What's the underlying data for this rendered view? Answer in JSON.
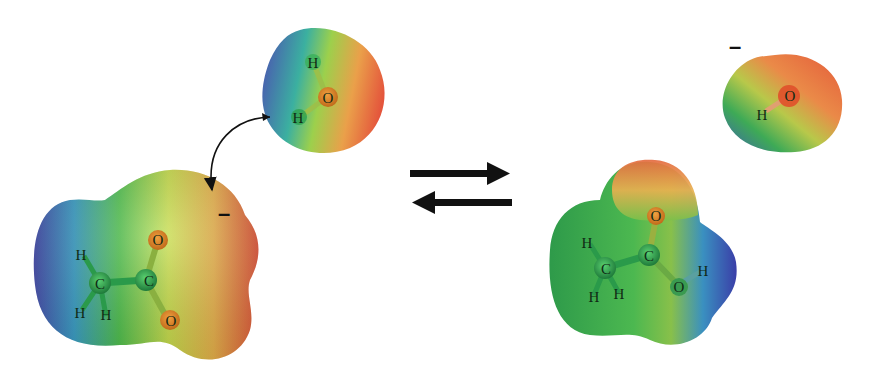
{
  "diagram": {
    "reactants": {
      "acetate": {
        "atoms": [
          "H",
          "H",
          "H",
          "C",
          "C",
          "O",
          "O"
        ],
        "labels": {
          "h1": "H",
          "h2": "H",
          "h3": "H",
          "c1": "C",
          "c2": "C",
          "o1": "O",
          "o2": "O"
        },
        "charge": "–"
      },
      "water": {
        "labels": {
          "h1": "H",
          "h2": "H",
          "o": "O"
        }
      }
    },
    "products": {
      "acetic_acid": {
        "labels": {
          "h1": "H",
          "h2": "H",
          "h3": "H",
          "c1": "C",
          "c2": "C",
          "o1": "O",
          "o2": "O",
          "h4": "H"
        }
      },
      "hydroxide": {
        "labels": {
          "o": "O",
          "h": "H"
        },
        "charge": "–"
      }
    },
    "arrows": {
      "equilibrium": "forward-and-reverse",
      "proton_transfer": "curved arrow from water H to acetate O"
    },
    "colors": {
      "negative_potential": "#e8503a",
      "neutral": "#4cb848",
      "positive_potential": "#3a4ca8",
      "intermediate_yellow": "#d8e24a",
      "arrow": "#111111"
    }
  }
}
